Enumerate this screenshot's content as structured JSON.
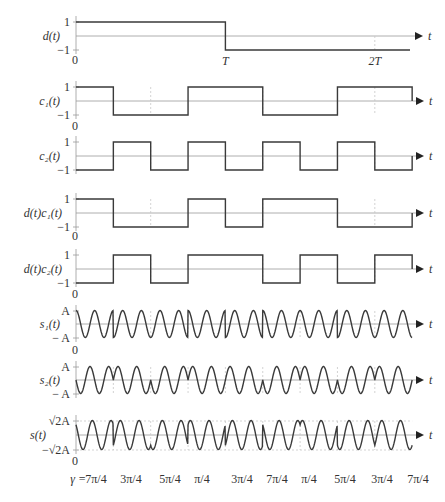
{
  "chart_data": {
    "type": "line",
    "title": "",
    "chips": 9,
    "time_axis": {
      "label": "t",
      "ticks": [
        {
          "label": "0",
          "chip": 0
        },
        {
          "label": "T",
          "chip": 4
        },
        {
          "label": "2T",
          "chip": 8
        }
      ]
    },
    "colors": {
      "signal": "#3a3a3a",
      "axis": "#9a9a9a",
      "grid": "#c8c8c8",
      "text": "#333333"
    },
    "panels": [
      {
        "id": "d",
        "ylabel": "d(t)",
        "type": "step",
        "values": [
          1,
          1,
          1,
          1,
          -1,
          -1,
          -1,
          -1,
          -1
        ],
        "ymax_label": "1",
        "ymin_label": "−1",
        "show_zero": true,
        "cut_at_chip": 8.9
      },
      {
        "id": "c1",
        "ylabel": "c₁(t)",
        "type": "step",
        "values": [
          1,
          -1,
          -1,
          1,
          1,
          -1,
          -1,
          1,
          1
        ],
        "ymax_label": "1",
        "ymin_label": "−1",
        "show_zero": true
      },
      {
        "id": "c2",
        "ylabel": "c₂(t)",
        "type": "step",
        "values": [
          -1,
          1,
          -1,
          1,
          -1,
          1,
          -1,
          1,
          -1
        ],
        "ymax_label": "1",
        "ymin_label": "−1",
        "show_zero": false
      },
      {
        "id": "dc1",
        "ylabel": "d(t)c₁(t)",
        "type": "step",
        "values": [
          1,
          -1,
          -1,
          1,
          -1,
          1,
          1,
          -1,
          -1
        ],
        "ymax_label": "1",
        "ymin_label": "−1",
        "show_zero": true
      },
      {
        "id": "dc2",
        "ylabel": "d(t)c₂(t)",
        "type": "step",
        "values": [
          -1,
          1,
          -1,
          1,
          1,
          -1,
          1,
          -1,
          1
        ],
        "ymax_label": "1",
        "ymin_label": "−1",
        "show_zero": true
      },
      {
        "id": "s1",
        "ylabel": "s₁(t)",
        "type": "carrier",
        "source": "dc1",
        "phase": "cos",
        "ymax_label": "A",
        "ymin_label": "− A",
        "show_zero": true
      },
      {
        "id": "s2",
        "ylabel": "s₂(t)",
        "type": "carrier",
        "source": "dc2",
        "phase": "sin",
        "ymax_label": "A",
        "ymin_label": "− A",
        "show_zero": true
      },
      {
        "id": "s",
        "ylabel": "s(t)",
        "type": "sum",
        "ymax_label": "√2A",
        "ymin_label": "−√2A",
        "show_zero": true
      }
    ],
    "carrier_cycles_per_chip": 2,
    "gamma": {
      "prefix": "γ =",
      "values": [
        "7π/4",
        "3π/4",
        "5π/4",
        "π/4",
        "3π/4",
        "7π/4",
        "π/4",
        "5π/4",
        "3π/4",
        "7π/4"
      ]
    }
  }
}
